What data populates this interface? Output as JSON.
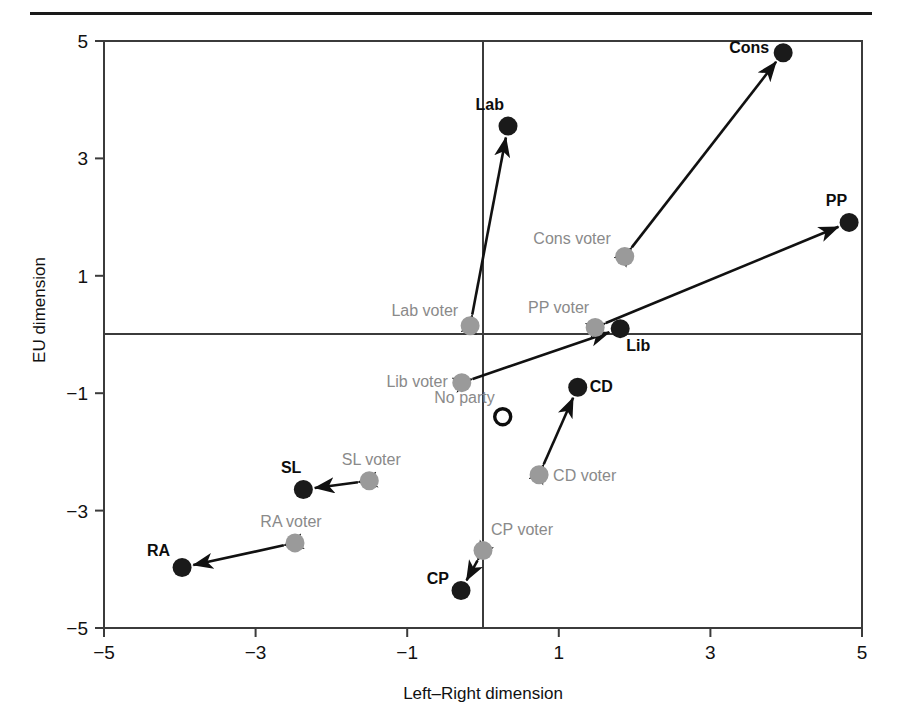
{
  "figure": {
    "has_top_rule": true,
    "background": "#ffffff"
  },
  "chart_data": {
    "type": "scatter",
    "title": "",
    "xlabel": "Left–Right dimension",
    "ylabel": "EU dimension",
    "xlim": [
      -5,
      5
    ],
    "ylim": [
      -5,
      5
    ],
    "xticks": [
      -5,
      -3,
      -1,
      1,
      3,
      5
    ],
    "yticks": [
      -5,
      -3,
      -1,
      1,
      3,
      5
    ],
    "xtick_labels": [
      "−5",
      "−3",
      "−1",
      "1",
      "3",
      "5"
    ],
    "ytick_labels": [
      "−5",
      "−3",
      "−1",
      "1",
      "3",
      "5"
    ],
    "grid": false,
    "zero_axes": true,
    "legend": "none",
    "colors": {
      "party_marker": "#1a1a1a",
      "voter_marker": "#9a9a9a",
      "no_party_marker_outline": "#0d0d0d",
      "arrow": "#111111",
      "frame": "#3b3b3b",
      "party_label": "#0d0d0d",
      "voter_label": "#8a8a8a"
    },
    "series": [
      {
        "name": "Parties",
        "marker": "filled-black-circle",
        "points": [
          {
            "label": "Lab",
            "x": 0.33,
            "y": 3.55,
            "label_dx": -4,
            "label_dy": -16,
            "label_anchor": "end"
          },
          {
            "label": "Cons",
            "x": 3.96,
            "y": 4.8,
            "label_dx": -14,
            "label_dy": 0,
            "label_anchor": "end"
          },
          {
            "label": "PP",
            "x": 4.83,
            "y": 1.91,
            "label_dx": -2,
            "label_dy": -16,
            "label_anchor": "end"
          },
          {
            "label": "Lib",
            "x": 1.81,
            "y": 0.1,
            "label_dx": 6,
            "label_dy": 22,
            "label_anchor": "start"
          },
          {
            "label": "CD",
            "x": 1.25,
            "y": -0.9,
            "label_dx": 12,
            "label_dy": 5,
            "label_anchor": "start"
          },
          {
            "label": "SL",
            "x": -2.37,
            "y": -2.64,
            "label_dx": -2,
            "label_dy": -16,
            "label_anchor": "end"
          },
          {
            "label": "RA",
            "x": -3.97,
            "y": -3.97,
            "label_dx": -12,
            "label_dy": -12,
            "label_anchor": "end"
          },
          {
            "label": "CP",
            "x": -0.29,
            "y": -4.36,
            "label_dx": -12,
            "label_dy": -6,
            "label_anchor": "end"
          }
        ]
      },
      {
        "name": "Voters",
        "marker": "filled-grey-circle",
        "points": [
          {
            "label": "Lab voter",
            "x": -0.17,
            "y": 0.15,
            "label_dx": -12,
            "label_dy": -10,
            "label_anchor": "end"
          },
          {
            "label": "Cons voter",
            "x": 1.87,
            "y": 1.33,
            "label_dx": -14,
            "label_dy": -12,
            "label_anchor": "end"
          },
          {
            "label": "PP voter",
            "x": 1.48,
            "y": 0.12,
            "label_dx": -6,
            "label_dy": -14,
            "label_anchor": "end"
          },
          {
            "label": "Lib voter",
            "x": -0.28,
            "y": -0.82,
            "label_dx": -14,
            "label_dy": 4,
            "label_anchor": "end"
          },
          {
            "label": "CD voter",
            "x": 0.74,
            "y": -2.39,
            "label_dx": 14,
            "label_dy": 6,
            "label_anchor": "start"
          },
          {
            "label": "SL voter",
            "x": -1.5,
            "y": -2.49,
            "label_dx": 2,
            "label_dy": -16,
            "label_anchor": "middle"
          },
          {
            "label": "RA voter",
            "x": -2.48,
            "y": -3.55,
            "label_dx": -4,
            "label_dy": -16,
            "label_anchor": "middle"
          },
          {
            "label": "CP voter",
            "x": 0.0,
            "y": -3.68,
            "label_dx": 8,
            "label_dy": -16,
            "label_anchor": "start"
          }
        ]
      },
      {
        "name": "No party",
        "marker": "hollow-black-circle",
        "points": [
          {
            "label": "No party",
            "x": 0.26,
            "y": -1.4,
            "label_dx": -8,
            "label_dy": -14,
            "label_anchor": "end"
          }
        ]
      }
    ],
    "connectors": [
      {
        "from": "Lab voter",
        "to": "Lab",
        "style": "double-headed-arrow"
      },
      {
        "from": "Cons voter",
        "to": "Cons",
        "style": "double-headed-arrow"
      },
      {
        "from": "PP voter",
        "to": "PP",
        "style": "double-headed-arrow"
      },
      {
        "from": "Lib voter",
        "to": "Lib",
        "style": "double-headed-arrow"
      },
      {
        "from": "CD voter",
        "to": "CD",
        "style": "double-headed-arrow"
      },
      {
        "from": "SL voter",
        "to": "SL",
        "style": "double-headed-arrow"
      },
      {
        "from": "RA voter",
        "to": "RA",
        "style": "double-headed-arrow"
      },
      {
        "from": "CP voter",
        "to": "CP",
        "style": "double-headed-arrow"
      }
    ]
  }
}
